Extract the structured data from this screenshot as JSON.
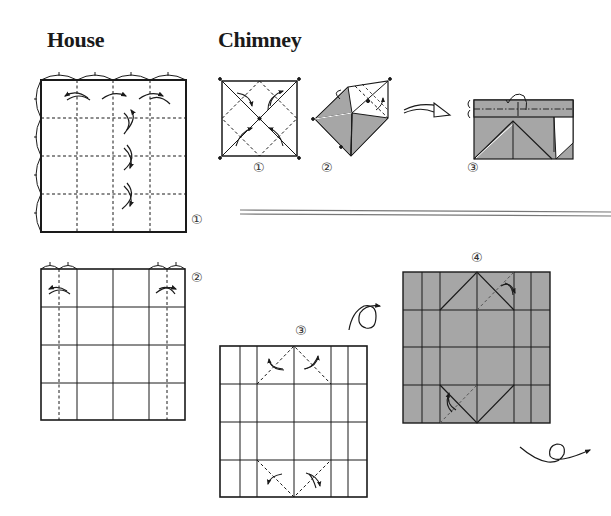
{
  "sections": {
    "house": {
      "title": "House",
      "steps": [
        {
          "number": "①",
          "description": "Square creased into 4x4 grid with valley folds (dashed)"
        },
        {
          "number": "②",
          "description": "Grid with outer columns folded toward center"
        }
      ]
    },
    "chimney": {
      "title": "Chimney",
      "steps": [
        {
          "number": "①",
          "description": "Square with diagonals and blintz fold lines"
        },
        {
          "number": "②",
          "description": "Partially collapsed, shaded underside showing"
        },
        {
          "number": "③",
          "description": "Rectangle with top flap folded back"
        },
        {
          "number": "③",
          "description": "Square grid with corner folds at top and bottom center"
        },
        {
          "number": "④",
          "description": "Gray reverse side with corner folds"
        }
      ]
    }
  },
  "colors": {
    "line": "#1a1a1a",
    "shade": "#a6a6a6",
    "shade_dark": "#999999",
    "separator": "#888888"
  }
}
